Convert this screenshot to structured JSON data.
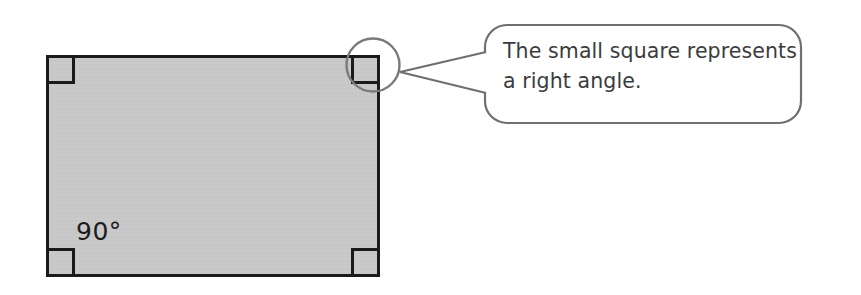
{
  "figure": {
    "type": "geometry-diagram",
    "shape": {
      "name": "rectangle",
      "fill_color": "#c8c8c8",
      "stroke_color": "#1a1a1a",
      "x": 46,
      "y": 55,
      "width": 334,
      "height": 222
    },
    "angle_markers": [
      {
        "name": "right-angle-marker-top-left",
        "corner": "top-left",
        "size": 26
      },
      {
        "name": "right-angle-marker-top-right",
        "corner": "top-right",
        "size": 26
      },
      {
        "name": "right-angle-marker-bottom-left",
        "corner": "bottom-left",
        "size": 26
      },
      {
        "name": "right-angle-marker-bottom-right",
        "corner": "bottom-right",
        "size": 26
      }
    ],
    "angle_label": {
      "text": "90°",
      "color": "#1c1c1c"
    },
    "highlight_circle": {
      "name": "highlight-circle",
      "cx": 373,
      "cy": 65,
      "r": 26.5,
      "stroke_color": "#7a7a7a"
    }
  },
  "callout": {
    "lines": [
      "The small square represents",
      "a right angle."
    ],
    "full_text": "The small square represents a right angle.",
    "stroke_color": "#6e6e73",
    "fill_color": "#ffffff",
    "text_color": "#3b3b40",
    "box": {
      "x": 485,
      "y": 25,
      "width": 316,
      "height": 98,
      "radius": 22
    },
    "tail": {
      "tip_x": 400,
      "tip_y": 72
    }
  },
  "colors": {
    "shape_fill": "#c8c8c8",
    "shape_stroke": "#1a1a1a",
    "callout_stroke": "#6e6e73",
    "text": "#3b3b40",
    "background": "#ffffff"
  }
}
